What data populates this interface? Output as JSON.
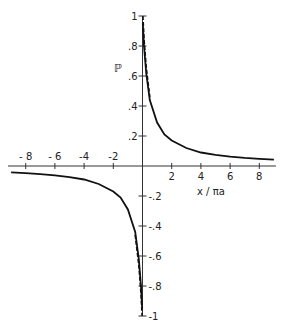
{
  "chart_data": {
    "type": "line",
    "title": "",
    "xlabel": "x / πa",
    "ylabel": "ℙ",
    "xlim": [
      -9,
      9
    ],
    "ylim": [
      -1,
      1
    ],
    "grid": false,
    "legend": null,
    "x_ticks": [
      -8,
      -6,
      -4,
      -2,
      2,
      4,
      6,
      8
    ],
    "x_tick_labels": [
      "- 8",
      "- 6",
      "-4",
      "-2",
      "2",
      "4",
      "6",
      "8"
    ],
    "y_ticks": [
      1,
      0.8,
      0.6,
      0.4,
      0.2,
      -0.2,
      -0.4,
      -0.6,
      -0.8,
      -1
    ],
    "y_tick_labels": [
      "1",
      ".8",
      ".6",
      ".4",
      ".2",
      "-.2",
      "-.4",
      "-.6",
      "-.8",
      "-1"
    ],
    "series": [
      {
        "name": "solid",
        "style": "solid",
        "x": [
          0.02,
          0.1,
          0.25,
          0.5,
          1,
          1.5,
          2,
          3,
          4,
          5,
          6,
          7,
          8,
          9
        ],
        "y": [
          0.95,
          0.8,
          0.62,
          0.44,
          0.29,
          0.21,
          0.17,
          0.12,
          0.09,
          0.074,
          0.063,
          0.054,
          0.048,
          0.043
        ]
      },
      {
        "name": "solid-negative",
        "style": "solid",
        "x": [
          -9,
          -8,
          -7,
          -6,
          -5,
          -4,
          -3,
          -2,
          -1.5,
          -1,
          -0.5,
          -0.25,
          -0.1,
          -0.02
        ],
        "y": [
          -0.043,
          -0.048,
          -0.054,
          -0.063,
          -0.074,
          -0.09,
          -0.12,
          -0.17,
          -0.21,
          -0.29,
          -0.44,
          -0.62,
          -0.8,
          -0.95
        ]
      },
      {
        "name": "dashed",
        "style": "dashed",
        "x": [
          0.03,
          0.1,
          0.25,
          0.5
        ],
        "y": [
          1.0,
          0.85,
          0.66,
          0.46
        ]
      },
      {
        "name": "dashed-negative",
        "style": "dashed",
        "x": [
          -0.5,
          -0.25,
          -0.1,
          -0.03
        ],
        "y": [
          -0.46,
          -0.66,
          -0.85,
          -1.0
        ]
      }
    ]
  }
}
